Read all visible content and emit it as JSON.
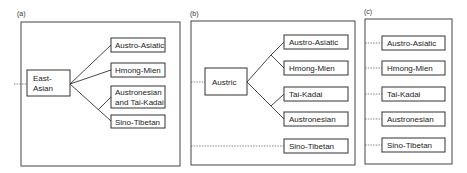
{
  "panels": [
    {
      "id": "a",
      "label": "(a)",
      "root": {
        "lines": [
          "East-",
          "Asian"
        ]
      },
      "leaves": [
        {
          "lines": [
            "Austro-Asiatic"
          ]
        },
        {
          "lines": [
            "Hmong-Mien"
          ]
        },
        {
          "lines": [
            "Austronesian",
            "and Tai-Kadai"
          ]
        },
        {
          "lines": [
            "Sino-Tibetan"
          ]
        }
      ]
    },
    {
      "id": "b",
      "label": "(b)",
      "root": {
        "lines": [
          "Austric"
        ]
      },
      "leaves": [
        {
          "lines": [
            "Austro-Asiatic"
          ]
        },
        {
          "lines": [
            "Hmong-Mien"
          ]
        },
        {
          "lines": [
            "Tai-Kadai"
          ]
        },
        {
          "lines": [
            "Austronesian"
          ]
        },
        {
          "lines": [
            "Sino-Tibetan"
          ]
        }
      ]
    },
    {
      "id": "c",
      "label": "(c)",
      "leaves": [
        {
          "lines": [
            "Austro-Asiatic"
          ]
        },
        {
          "lines": [
            "Hmong-Mien"
          ]
        },
        {
          "lines": [
            "Tai-Kadai"
          ]
        },
        {
          "lines": [
            "Austronesian"
          ]
        },
        {
          "lines": [
            "Sino-Tibetan"
          ]
        }
      ]
    }
  ]
}
